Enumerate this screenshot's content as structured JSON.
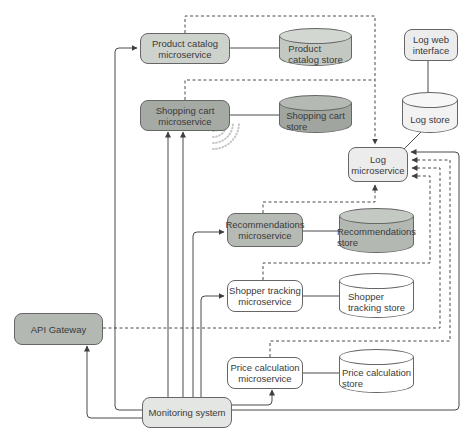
{
  "diagram": {
    "colors": {
      "bg": "#ffffff",
      "border": "#666666",
      "line": "#4b4b4b",
      "text": "#3a3a3a",
      "arrow": "#3f3f3f"
    },
    "nodes": {
      "product_catalog_ms": {
        "label": "Product catalog\nmicroservice",
        "fill": "#cdd2cc"
      },
      "shopping_cart_ms": {
        "label": "Shopping cart\nmicroservice",
        "fill": "#a5aaa4"
      },
      "product_catalog_store": {
        "label": "Product\ncatalog store",
        "fill": "#c3c8c2",
        "fill_top": "#d3d7d2"
      },
      "shopping_cart_store": {
        "label": "Shopping cart\nstore",
        "fill": "#a0a5a0",
        "fill_top": "#b4b9b3"
      },
      "log_web_interface": {
        "label": "Log web\ninterface",
        "fill": "#ececec"
      },
      "log_store": {
        "label": "Log store",
        "fill": "#f2f2f2",
        "fill_top": "#f7f7f7"
      },
      "log_ms": {
        "label": "Log\nmicroservice",
        "fill": "#ececec"
      },
      "recommendations_ms": {
        "label": "Recommendations\nmicroservice",
        "fill": "#b6bab5"
      },
      "recommendations_store": {
        "label": "Recommendations\nstore",
        "fill": "#b3b8b2",
        "fill_top": "#c5c9c4"
      },
      "shopper_tracking_ms": {
        "label": "Shopper tracking\nmicroservice",
        "fill": "#ffffff"
      },
      "shopper_tracking_store": {
        "label": "Shopper\ntracking store",
        "fill": "#ffffff",
        "fill_top": "#ffffff"
      },
      "price_calculation_ms": {
        "label": "Price calculation\nmicroservice",
        "fill": "#ffffff"
      },
      "price_calculation_store": {
        "label": "Price calculation\nstore",
        "fill": "#ffffff",
        "fill_top": "#ffffff"
      },
      "api_gateway": {
        "label": "API Gateway",
        "fill": "#b3b8b2"
      },
      "monitoring_system": {
        "label": "Monitoring system",
        "fill": "#e3e6e2"
      }
    },
    "icons": {
      "event_feed": "broadcast-waves-icon"
    }
  }
}
